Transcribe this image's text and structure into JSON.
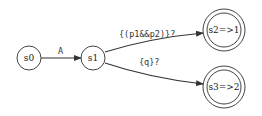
{
  "diagram": {
    "type": "state-machine",
    "colors": {
      "stroke": "#444444",
      "text": "#222222",
      "background": "#ffffff"
    },
    "nodes": [
      {
        "id": "s0",
        "label": "s0",
        "accepting": false
      },
      {
        "id": "s1",
        "label": "s1",
        "accepting": false
      },
      {
        "id": "s2",
        "label": "s2=>1",
        "accepting": true
      },
      {
        "id": "s3",
        "label": "s3=>2",
        "accepting": true
      }
    ],
    "edges": [
      {
        "from": "s0",
        "to": "s1",
        "label": "A"
      },
      {
        "from": "s1",
        "to": "s2",
        "label": "{(p1&&p2)}?"
      },
      {
        "from": "s1",
        "to": "s3",
        "label": "{q}?"
      }
    ]
  }
}
